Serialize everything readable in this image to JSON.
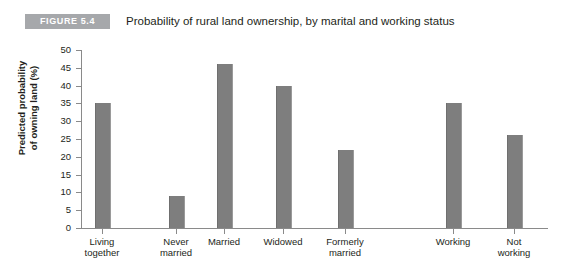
{
  "figure": {
    "badge": "FIGURE 5.4",
    "title": "Probability of rural land ownership, by marital and working status"
  },
  "colors": {
    "bar": "#7e7e7e",
    "badge_background": "#a6a8ab",
    "badge_text": "#ffffff",
    "axis": "#8a8a8a",
    "text": "#231f20",
    "page_background": "#ffffff"
  },
  "chart_data": {
    "type": "bar",
    "title": "Probability of rural land ownership, by marital and working status",
    "xlabel": "",
    "ylabel": "Predicted probability of owning land (%)",
    "ylabel_line1": "Predicted probability",
    "ylabel_line2": "of owning land (%)",
    "categories": [
      "Living\ntogether",
      "Never\nmarried",
      "Married",
      "Widowed",
      "Formerly\nmarried",
      "Working",
      "Not\nworking"
    ],
    "values": [
      35,
      9,
      46,
      40,
      22,
      35,
      26
    ],
    "ylim": [
      0,
      50
    ],
    "ytick_values": [
      0,
      5,
      10,
      15,
      20,
      25,
      30,
      35,
      40,
      45,
      50
    ],
    "ytick_labels": [
      "0",
      "5",
      "10",
      "15",
      "20",
      "25",
      "30",
      "35",
      "40",
      "45",
      "50"
    ],
    "grid": false,
    "legend": false,
    "legend_position": "none",
    "bar_centers_px": [
      102,
      176,
      224,
      283,
      345,
      453,
      514
    ],
    "bar_width_px": 14
  }
}
